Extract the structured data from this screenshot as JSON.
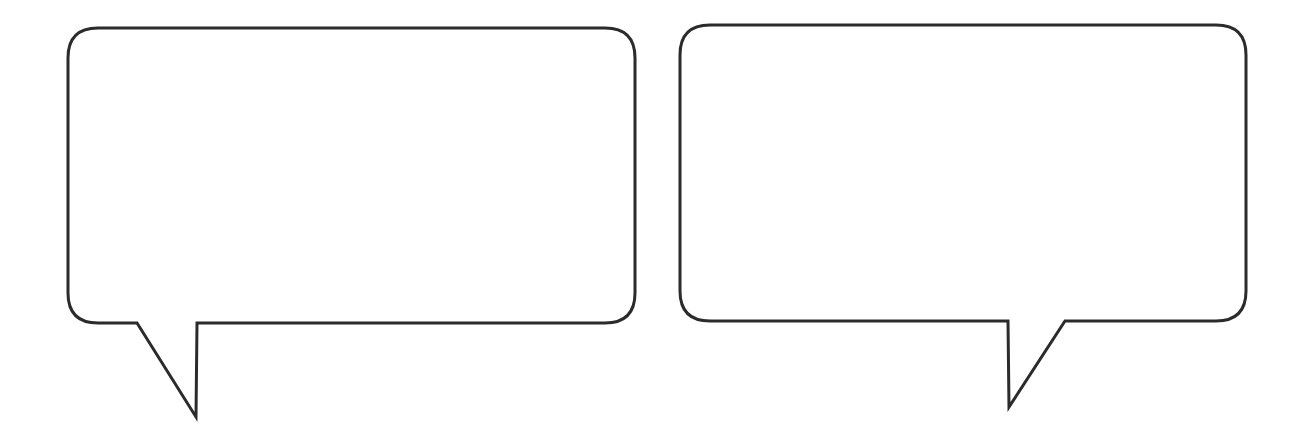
{
  "scene": {
    "background": "#ffffff",
    "stroke_color": "#2b2b2b",
    "fill_color": "#ffffff"
  },
  "bubbles": [
    {
      "id": "left",
      "text": "",
      "tail_direction": "bottom-left"
    },
    {
      "id": "right",
      "text": "",
      "tail_direction": "bottom-right"
    }
  ]
}
